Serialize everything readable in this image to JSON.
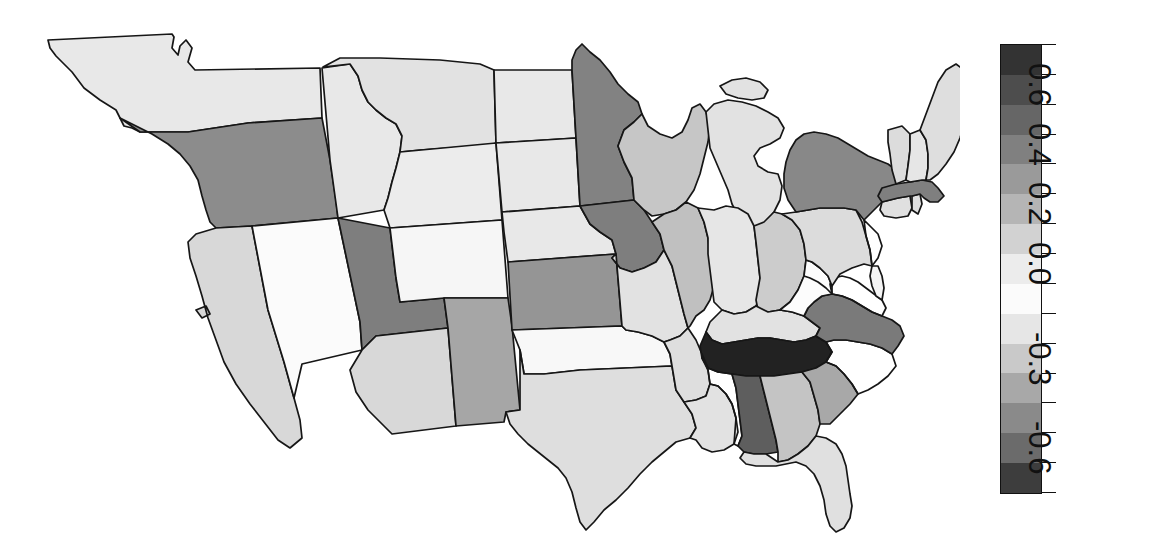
{
  "figure": {
    "type": "choropleth-map",
    "region": "United States (contiguous, 48 states + DC)",
    "background_color": "#ffffff",
    "border_color": "#161616"
  },
  "colorbar": {
    "orientation": "vertical",
    "label_rotation_deg": 90,
    "outline_color": "#111111",
    "tick_labels": [
      "0.6",
      "0.4",
      "0.2",
      "0.0",
      "-0.3",
      "-0.6"
    ],
    "tick_values": [
      0.6,
      0.4,
      0.2,
      0.0,
      -0.3,
      -0.6
    ],
    "vmin": -0.75,
    "vmax": 0.75,
    "n_bands": 12,
    "band_colors": [
      "#333333",
      "#4d4d4d",
      "#666666",
      "#808080",
      "#9a9a9a",
      "#b5b5b5",
      "#d2d2d2",
      "#ececec",
      "#fbfbfb",
      "#e6e6e6",
      "#c9c9c9",
      "#a8a8a8",
      "#8a8a8a",
      "#6b6b6b",
      "#3d3d3d"
    ],
    "tick_positions_pct": [
      4.0,
      13.2,
      26.4,
      39.6,
      52.8,
      66.0,
      79.2,
      92.4
    ]
  },
  "chart_data": {
    "type": "heatmap",
    "title": "",
    "xlabel": "",
    "ylabel": "",
    "colorbar_label": "",
    "cmap": "grayscale (dark = high, white = zero, gray = low)",
    "vmin": -0.75,
    "vmax": 0.75,
    "units": "correlation / effect size",
    "categories": [
      "Washington",
      "Oregon",
      "California",
      "Nevada",
      "Idaho",
      "Montana",
      "Wyoming",
      "Utah",
      "Colorado",
      "Arizona",
      "New Mexico",
      "North Dakota",
      "South Dakota",
      "Nebraska",
      "Kansas",
      "Oklahoma",
      "Texas",
      "Minnesota",
      "Iowa",
      "Missouri",
      "Arkansas",
      "Louisiana",
      "Wisconsin",
      "Illinois",
      "Michigan",
      "Indiana",
      "Ohio",
      "Kentucky",
      "Tennessee",
      "Mississippi",
      "Alabama",
      "Georgia",
      "Florida",
      "South Carolina",
      "North Carolina",
      "Virginia",
      "West Virginia",
      "Maryland",
      "Delaware",
      "Pennsylvania",
      "New Jersey",
      "New York",
      "Connecticut",
      "Rhode Island",
      "Massachusetts",
      "Vermont",
      "New Hampshire",
      "Maine"
    ],
    "values": [
      -0.12,
      0.35,
      -0.18,
      0.02,
      -0.1,
      -0.12,
      -0.08,
      0.42,
      0.02,
      -0.2,
      0.22,
      -0.1,
      -0.12,
      -0.1,
      0.28,
      0.01,
      -0.16,
      0.4,
      0.44,
      -0.12,
      -0.14,
      -0.12,
      -0.24,
      -0.26,
      -0.12,
      -0.1,
      -0.22,
      -0.08,
      0.72,
      0.36,
      0.55,
      -0.28,
      -0.12,
      -0.3,
      -0.3,
      0.42,
      0.0,
      0.62,
      0.02,
      -0.1,
      0.0,
      0.38,
      -0.14,
      -0.14,
      0.4,
      -0.14,
      -0.12,
      -0.12
    ],
    "legend": "grayscale colorbar, right of map",
    "grid": false
  },
  "states": [
    {
      "code": "WA",
      "name": "Washington",
      "value": -0.12,
      "fill": "#e8e8e8"
    },
    {
      "code": "OR",
      "name": "Oregon",
      "value": 0.35,
      "fill": "#8c8c8c"
    },
    {
      "code": "CA",
      "name": "California",
      "value": -0.18,
      "fill": "#d8d8d8"
    },
    {
      "code": "NV",
      "name": "Nevada",
      "value": 0.02,
      "fill": "#fbfbfb"
    },
    {
      "code": "ID",
      "name": "Idaho",
      "value": -0.1,
      "fill": "#e8e8e8"
    },
    {
      "code": "MT",
      "name": "Montana",
      "value": -0.12,
      "fill": "#e2e2e2"
    },
    {
      "code": "WY",
      "name": "Wyoming",
      "value": -0.08,
      "fill": "#ececec"
    },
    {
      "code": "UT",
      "name": "Utah",
      "value": 0.42,
      "fill": "#7e7e7e"
    },
    {
      "code": "CO",
      "name": "Colorado",
      "value": 0.02,
      "fill": "#f6f6f6"
    },
    {
      "code": "AZ",
      "name": "Arizona",
      "value": -0.2,
      "fill": "#d8d8d8"
    },
    {
      "code": "NM",
      "name": "New Mexico",
      "value": 0.22,
      "fill": "#a6a6a6"
    },
    {
      "code": "ND",
      "name": "North Dakota",
      "value": -0.1,
      "fill": "#e8e8e8"
    },
    {
      "code": "SD",
      "name": "South Dakota",
      "value": -0.12,
      "fill": "#e8e8e8"
    },
    {
      "code": "NE",
      "name": "Nebraska",
      "value": -0.1,
      "fill": "#e8e8e8"
    },
    {
      "code": "KS",
      "name": "Kansas",
      "value": 0.28,
      "fill": "#959595"
    },
    {
      "code": "OK",
      "name": "Oklahoma",
      "value": 0.01,
      "fill": "#f8f8f8"
    },
    {
      "code": "TX",
      "name": "Texas",
      "value": -0.16,
      "fill": "#dedede"
    },
    {
      "code": "MN",
      "name": "Minnesota",
      "value": 0.4,
      "fill": "#828282"
    },
    {
      "code": "IA",
      "name": "Iowa",
      "value": 0.44,
      "fill": "#7e7e7e"
    },
    {
      "code": "MO",
      "name": "Missouri",
      "value": -0.12,
      "fill": "#e2e2e2"
    },
    {
      "code": "AR",
      "name": "Arkansas",
      "value": -0.14,
      "fill": "#dedede"
    },
    {
      "code": "LA",
      "name": "Louisiana",
      "value": -0.12,
      "fill": "#e2e2e2"
    },
    {
      "code": "WI",
      "name": "Wisconsin",
      "value": -0.24,
      "fill": "#c6c6c6"
    },
    {
      "code": "IL",
      "name": "Illinois",
      "value": -0.26,
      "fill": "#c0c0c0"
    },
    {
      "code": "MI",
      "name": "Michigan",
      "value": -0.12,
      "fill": "#e2e2e2"
    },
    {
      "code": "IN",
      "name": "Indiana",
      "value": -0.1,
      "fill": "#e6e6e6"
    },
    {
      "code": "OH",
      "name": "Ohio",
      "value": -0.22,
      "fill": "#cccccc"
    },
    {
      "code": "KY",
      "name": "Kentucky",
      "value": -0.08,
      "fill": "#e2e2e2"
    },
    {
      "code": "TN",
      "name": "Tennessee",
      "value": 0.72,
      "fill": "#222222"
    },
    {
      "code": "MS",
      "name": "Mississippi",
      "value": 0.36,
      "fill": "#8a8a8a"
    },
    {
      "code": "AL",
      "name": "Alabama",
      "value": 0.55,
      "fill": "#5e5e5e"
    },
    {
      "code": "GA",
      "name": "Georgia",
      "value": -0.28,
      "fill": "#c4c4c4"
    },
    {
      "code": "FL",
      "name": "Florida",
      "value": -0.12,
      "fill": "#e0e0e0"
    },
    {
      "code": "SC",
      "name": "South Carolina",
      "value": -0.3,
      "fill": "#a8a8a8"
    },
    {
      "code": "NC",
      "name": "North Carolina",
      "value": -0.3,
      "fill": "#a8a8a8"
    },
    {
      "code": "VA",
      "name": "Virginia",
      "value": 0.42,
      "fill": "#7a7a7a"
    },
    {
      "code": "WV",
      "name": "West Virginia",
      "value": 0.0,
      "fill": "#fcfcfc"
    },
    {
      "code": "MD",
      "name": "Maryland",
      "value": 0.62,
      "fill": "#4a4a4a"
    },
    {
      "code": "DE",
      "name": "Delaware",
      "value": 0.02,
      "fill": "#f4f4f4"
    },
    {
      "code": "PA",
      "name": "Pennsylvania",
      "value": -0.1,
      "fill": "#dcdcdc"
    },
    {
      "code": "NJ",
      "name": "New Jersey",
      "value": 0.0,
      "fill": "#fbfbfb"
    },
    {
      "code": "NY",
      "name": "New York",
      "value": 0.38,
      "fill": "#888888"
    },
    {
      "code": "CT",
      "name": "Connecticut",
      "value": -0.14,
      "fill": "#e0e0e0"
    },
    {
      "code": "RI",
      "name": "Rhode Island",
      "value": -0.14,
      "fill": "#e0e0e0"
    },
    {
      "code": "MA",
      "name": "Massachusetts",
      "value": 0.4,
      "fill": "#7f7f7f"
    },
    {
      "code": "VT",
      "name": "Vermont",
      "value": -0.14,
      "fill": "#dcdcdc"
    },
    {
      "code": "NH",
      "name": "New Hampshire",
      "value": -0.12,
      "fill": "#e6e6e6"
    },
    {
      "code": "ME",
      "name": "Maine",
      "value": -0.12,
      "fill": "#dedede"
    }
  ]
}
